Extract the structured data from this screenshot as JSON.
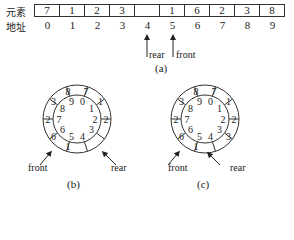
{
  "part_a": {
    "row_label_elements": "元素",
    "row_label_address": "地址",
    "elements": [
      "7",
      "1",
      "2",
      "3",
      "",
      "1",
      "6",
      "2",
      "3",
      "8"
    ],
    "addresses": [
      "0",
      "1",
      "2",
      "3",
      "4",
      "5",
      "6",
      "7",
      "8",
      "9"
    ],
    "rear_label": "rear",
    "front_label": "front",
    "rear_index": 4,
    "front_index": 5,
    "caption": "(a)"
  },
  "part_b": {
    "caption": "(b)",
    "front_label": "front",
    "rear_label": "rear",
    "slot_values": [
      "7",
      "1",
      "2",
      "",
      "",
      "1",
      "6",
      "2",
      "3",
      "8"
    ],
    "slot_indices": [
      "0",
      "1",
      "2",
      "3",
      "4",
      "5",
      "6",
      "7",
      "8",
      "9"
    ]
  },
  "part_c": {
    "caption": "(c)",
    "front_label": "front",
    "rear_label": "rear",
    "slot_values": [
      "7",
      "1",
      "2",
      "3",
      "",
      "1",
      "6",
      "2",
      "3",
      "8"
    ],
    "slot_indices": [
      "0",
      "1",
      "2",
      "3",
      "4",
      "5",
      "6",
      "7",
      "8",
      "9"
    ]
  }
}
